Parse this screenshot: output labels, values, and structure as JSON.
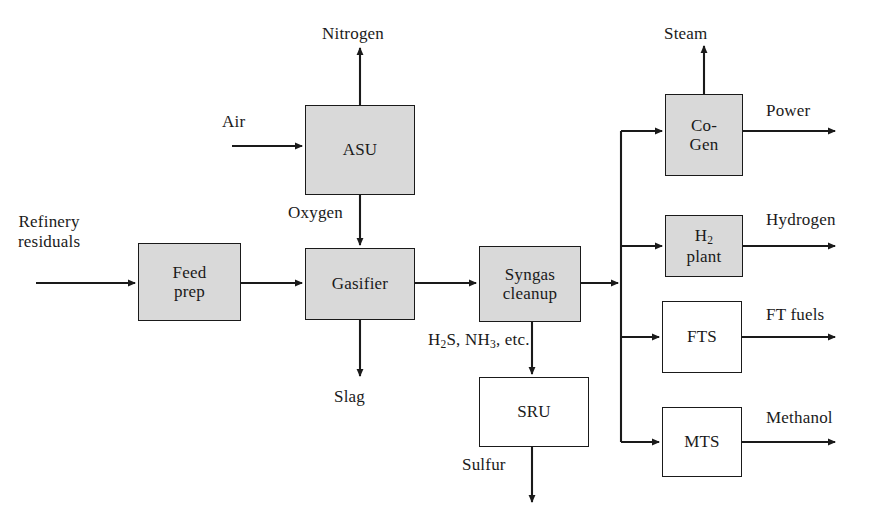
{
  "diagram": {
    "type": "process-flow",
    "colors": {
      "shaded_fill": "#d9d9d9",
      "plain_fill": "#ffffff",
      "stroke": "#1a1a1a",
      "background": "#ffffff"
    },
    "nodes": [
      {
        "id": "feed_prep",
        "label_line1": "Feed",
        "label_line2": "prep",
        "fill": "shaded",
        "x": 138,
        "y": 243,
        "w": 103,
        "h": 78
      },
      {
        "id": "asu",
        "label_line1": "ASU",
        "label_line2": "",
        "fill": "shaded",
        "x": 305,
        "y": 105,
        "w": 110,
        "h": 90
      },
      {
        "id": "gasifier",
        "label_line1": "Gasifier",
        "label_line2": "",
        "fill": "shaded",
        "x": 305,
        "y": 248,
        "w": 110,
        "h": 72
      },
      {
        "id": "syngas_cleanup",
        "label_line1": "Syngas",
        "label_line2": "cleanup",
        "fill": "shaded",
        "x": 479,
        "y": 246,
        "w": 102,
        "h": 76
      },
      {
        "id": "sru",
        "label_line1": "SRU",
        "label_line2": "",
        "fill": "plain",
        "x": 479,
        "y": 377,
        "w": 110,
        "h": 70
      },
      {
        "id": "cogen",
        "label_line1": "Co-",
        "label_line2": "Gen",
        "fill": "shaded",
        "x": 665,
        "y": 94,
        "w": 78,
        "h": 82
      },
      {
        "id": "h2_plant",
        "label_line1": "H2",
        "label_line2": "plant",
        "fill": "shaded",
        "x": 665,
        "y": 215,
        "w": 78,
        "h": 62
      },
      {
        "id": "fts",
        "label_line1": "FTS",
        "label_line2": "",
        "fill": "plain",
        "x": 662,
        "y": 301,
        "w": 80,
        "h": 72
      },
      {
        "id": "mts",
        "label_line1": "MTS",
        "label_line2": "",
        "fill": "plain",
        "x": 662,
        "y": 407,
        "w": 80,
        "h": 70
      }
    ],
    "stream_labels": [
      {
        "id": "refinery_residuals",
        "text_line1": "Refinery",
        "text_line2": "residuals",
        "x": 18,
        "y": 212
      },
      {
        "id": "air",
        "text_line1": "Air",
        "text_line2": "",
        "x": 222,
        "y": 112
      },
      {
        "id": "nitrogen",
        "text_line1": "Nitrogen",
        "text_line2": "",
        "x": 322,
        "y": 24
      },
      {
        "id": "oxygen",
        "text_line1": "Oxygen",
        "text_line2": "",
        "x": 288,
        "y": 203
      },
      {
        "id": "slag",
        "text_line1": "Slag",
        "text_line2": "",
        "x": 334,
        "y": 387
      },
      {
        "id": "acid_gases",
        "text_line1": "H2S, NH3, etc.",
        "text_line2": "",
        "x": 428,
        "y": 330
      },
      {
        "id": "sulfur",
        "text_line1": "Sulfur",
        "text_line2": "",
        "x": 462,
        "y": 455
      },
      {
        "id": "steam",
        "text_line1": "Steam",
        "text_line2": "",
        "x": 664,
        "y": 24
      },
      {
        "id": "power",
        "text_line1": "Power",
        "text_line2": "",
        "x": 766,
        "y": 101
      },
      {
        "id": "hydrogen",
        "text_line1": "Hydrogen",
        "text_line2": "",
        "x": 766,
        "y": 210
      },
      {
        "id": "ft_fuels",
        "text_line1": "FT fuels",
        "text_line2": "",
        "x": 766,
        "y": 305
      },
      {
        "id": "methanol",
        "text_line1": "Methanol",
        "text_line2": "",
        "x": 766,
        "y": 408
      }
    ]
  }
}
